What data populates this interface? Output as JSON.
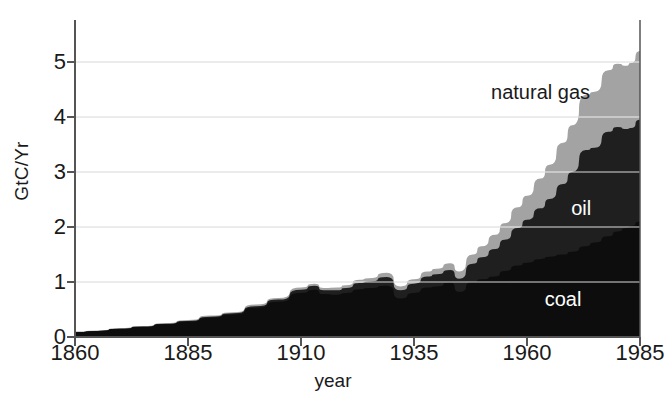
{
  "chart_data": {
    "type": "area",
    "stacked": true,
    "title": "",
    "subtitle": "",
    "xlabel": "year",
    "ylabel": "GtC/Yr",
    "xlim": [
      1860,
      1985
    ],
    "ylim": [
      0,
      5.6
    ],
    "xticks": [
      1860,
      1885,
      1910,
      1935,
      1960,
      1985
    ],
    "yticks": [
      0,
      1,
      2,
      3,
      4,
      5
    ],
    "xticklabels": [
      "1860",
      "1885",
      "1910",
      "1935",
      "1960",
      "1985"
    ],
    "yticklabels": [
      "0",
      "1",
      "2",
      "3",
      "4",
      "5"
    ],
    "grid": "horizontal",
    "legend_position": "inline-annotations",
    "colors": {
      "coal": "#0d0d0d",
      "oil": "#1f1f1f",
      "natural_gas": "#a3a3a3",
      "background": "#ffffff",
      "axis": "#555555",
      "gridline": "#d8d8d8",
      "text": "#1a1a1a",
      "inline_label_light": "#ffffff"
    },
    "annotations": [
      {
        "text": "natural gas",
        "x": 1963,
        "y": 4.45,
        "color": "dark"
      },
      {
        "text": "oil",
        "x": 1972,
        "y": 2.35,
        "color": "light"
      },
      {
        "text": "coal",
        "x": 1968,
        "y": 0.7,
        "color": "light"
      }
    ],
    "x": [
      1860,
      1865,
      1870,
      1875,
      1880,
      1885,
      1890,
      1895,
      1900,
      1905,
      1910,
      1913,
      1915,
      1918,
      1920,
      1923,
      1925,
      1929,
      1932,
      1935,
      1938,
      1940,
      1943,
      1945,
      1948,
      1950,
      1953,
      1955,
      1958,
      1960,
      1963,
      1965,
      1968,
      1970,
      1973,
      1975,
      1978,
      1980,
      1982,
      1983,
      1985
    ],
    "series": [
      {
        "name": "coal",
        "label": "coal",
        "color": "#0d0d0d",
        "values": [
          0.09,
          0.11,
          0.15,
          0.18,
          0.23,
          0.28,
          0.35,
          0.41,
          0.53,
          0.64,
          0.8,
          0.86,
          0.78,
          0.77,
          0.8,
          0.87,
          0.89,
          0.93,
          0.7,
          0.8,
          0.9,
          0.92,
          0.99,
          0.82,
          1.0,
          1.05,
          1.1,
          1.2,
          1.3,
          1.35,
          1.42,
          1.46,
          1.5,
          1.55,
          1.65,
          1.72,
          1.83,
          1.92,
          1.98,
          2.02,
          2.1
        ]
      },
      {
        "name": "oil",
        "label": "oil",
        "color": "#1f1f1f",
        "values": [
          0.0,
          0.0,
          0.0,
          0.01,
          0.01,
          0.01,
          0.02,
          0.02,
          0.03,
          0.04,
          0.06,
          0.07,
          0.07,
          0.08,
          0.09,
          0.11,
          0.12,
          0.16,
          0.15,
          0.17,
          0.2,
          0.22,
          0.23,
          0.24,
          0.33,
          0.4,
          0.5,
          0.57,
          0.68,
          0.78,
          0.92,
          1.05,
          1.28,
          1.45,
          1.75,
          1.72,
          1.9,
          1.9,
          1.8,
          1.78,
          1.85
        ]
      },
      {
        "name": "natural gas",
        "label": "natural gas",
        "color": "#a3a3a3",
        "values": [
          0.01,
          0.01,
          0.01,
          0.01,
          0.01,
          0.02,
          0.02,
          0.02,
          0.03,
          0.03,
          0.04,
          0.04,
          0.04,
          0.05,
          0.05,
          0.06,
          0.06,
          0.08,
          0.07,
          0.08,
          0.09,
          0.1,
          0.12,
          0.13,
          0.17,
          0.2,
          0.26,
          0.3,
          0.38,
          0.44,
          0.54,
          0.62,
          0.75,
          0.85,
          1.0,
          1.02,
          1.12,
          1.15,
          1.15,
          1.18,
          1.25
        ]
      }
    ]
  }
}
